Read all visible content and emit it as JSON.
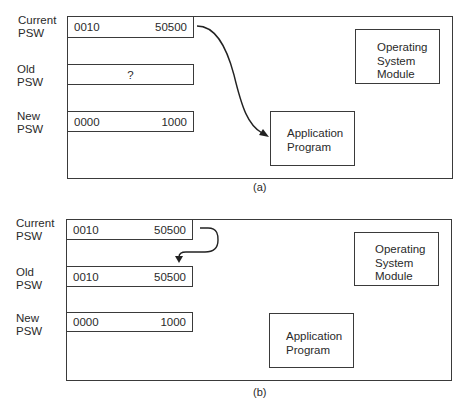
{
  "panels": [
    {
      "caption": "(a)",
      "registers": [
        {
          "label_line1": "Current",
          "label_line2": "PSW",
          "left": "0010",
          "right": "50500",
          "center": ""
        },
        {
          "label_line1": "Old",
          "label_line2": "PSW",
          "left": "",
          "right": "",
          "center": "?"
        },
        {
          "label_line1": "New",
          "label_line2": "PSW",
          "left": "0000",
          "right": "1000",
          "center": ""
        }
      ],
      "os_module": {
        "line1": "Operating",
        "line2": "System",
        "line3": "Module"
      },
      "app_program": {
        "line1": "Application",
        "line2": "Program"
      },
      "arrow": "Current PSW → Application Program"
    },
    {
      "caption": "(b)",
      "registers": [
        {
          "label_line1": "Current",
          "label_line2": "PSW",
          "left": "0010",
          "right": "50500",
          "center": ""
        },
        {
          "label_line1": "Old",
          "label_line2": "PSW",
          "left": "0010",
          "right": "50500",
          "center": ""
        },
        {
          "label_line1": "New",
          "label_line2": "PSW",
          "left": "0000",
          "right": "1000",
          "center": ""
        }
      ],
      "os_module": {
        "line1": "Operating",
        "line2": "System",
        "line3": "Module"
      },
      "app_program": {
        "line1": "Application",
        "line2": "Program"
      },
      "arrow": "Current PSW → Old PSW"
    }
  ]
}
